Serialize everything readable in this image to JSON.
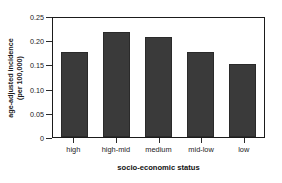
{
  "figure": {
    "title_sliver": "",
    "background": "#ffffff",
    "bar_color": "#3a3a3a",
    "axis_color": "#1b1b1b"
  },
  "chart_data": {
    "type": "bar",
    "title": "",
    "categories": [
      "high",
      "high-mid",
      "medium",
      "mid-low",
      "low"
    ],
    "values": [
      0.176,
      0.217,
      0.207,
      0.176,
      0.151
    ],
    "xlabel": "socio-economic status",
    "ylabel": "age-adjusted incidence (per 100,000)",
    "ylabel_line1": "age-adjusted incidence",
    "ylabel_line2": "(per 100,000)",
    "ylim": [
      0,
      0.25
    ],
    "yticks": [
      "0.25",
      "0.20",
      "0.15",
      "0.10",
      "0.05",
      "0"
    ],
    "ytick_values": [
      0.25,
      0.2,
      0.15,
      0.1,
      0.05,
      0
    ],
    "grid": false,
    "legend": null,
    "series": [
      {
        "name": "age-adjusted incidence",
        "values": [
          0.176,
          0.217,
          0.207,
          0.176,
          0.151
        ]
      }
    ]
  }
}
